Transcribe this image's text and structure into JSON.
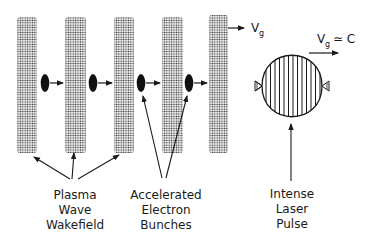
{
  "diagram": {
    "type": "plasma-wakefield-acceleration-schematic",
    "wakefield_columns": 5,
    "electron_bunches": 4,
    "labels": {
      "wakefield": [
        "Plasma",
        "Wave",
        "Wakefield"
      ],
      "bunches": [
        "Accelerated",
        "Electron",
        "Bunches"
      ],
      "laser": [
        "Intense",
        "Laser",
        "Pulse"
      ]
    },
    "velocity": {
      "wake_symbol": "V",
      "wake_subscript": "g",
      "laser_symbol": "V",
      "laser_subscript": "g",
      "laser_relation": "≃ C"
    },
    "colors": {
      "ink": "#1a1a1a",
      "stipple": "#333333",
      "background": "#ffffff"
    }
  }
}
